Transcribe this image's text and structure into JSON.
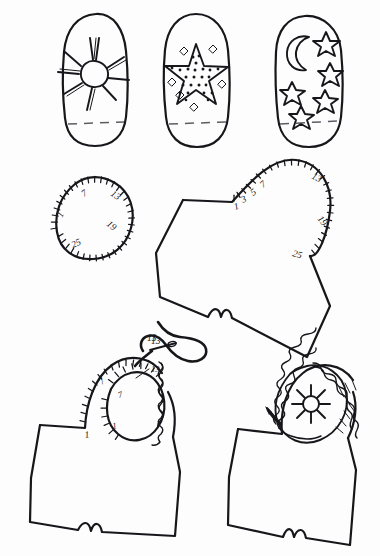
{
  "page": {
    "background_color": "#fdfdfd",
    "ink_color": "#17161a",
    "fold_line_color": "#5d5c62",
    "width": 380,
    "height": 556
  },
  "figures": {
    "row_top": {
      "name": "decorated-mitten-panels",
      "panels": [
        {
          "id": "panel-sun",
          "motif": "sun-icon",
          "motif_label": "sun with rays",
          "has_fold_line": true
        },
        {
          "id": "panel-star",
          "motif": "textured-star-icon",
          "motif_label": "large dotted star with small diamonds",
          "has_fold_line": true
        },
        {
          "id": "panel-moonstars",
          "motif": "moon-stars-icon",
          "motif_label": "crescent moon with five stars",
          "has_fold_line": true
        }
      ]
    },
    "oval_patch": {
      "name": "numbered-oval-patch",
      "tick_labels": [
        "1",
        "7",
        "13",
        "19",
        "25"
      ],
      "total_ticks": 30
    },
    "mitten_blank": {
      "name": "numbered-mitten-blank",
      "tick_labels": [
        "1",
        "3",
        "5",
        "7",
        "13",
        "19",
        "25"
      ],
      "total_ticks": 27
    },
    "step_stitching": {
      "name": "mitten-stitching-step",
      "mitten_tick_labels": [
        "1",
        "7",
        "13"
      ],
      "patch_tick_labels": [
        "1",
        "7",
        "13"
      ],
      "needle_label": "13",
      "has_needle_and_thread": true,
      "has_blanket_stitch_edge": true
    },
    "step_finished": {
      "name": "finished-mitten",
      "motif": "sun-icon",
      "motif_label": "sun with rays",
      "has_blanket_stitch_edge": true,
      "has_needle_and_thread": true
    }
  },
  "labels": {
    "oval_1": "1",
    "oval_7": "7",
    "oval_13": "13",
    "oval_19": "19",
    "oval_25": "25",
    "mitten_1": "1",
    "mitten_3": "3",
    "mitten_5": "5",
    "mitten_7": "7",
    "mitten_13": "13",
    "mitten_19": "19",
    "mitten_25": "25",
    "step_mitten_1": "1",
    "step_mitten_7": "7",
    "step_mitten_13": "13",
    "step_patch_1": "1",
    "step_patch_7": "7",
    "step_patch_13": "13"
  }
}
